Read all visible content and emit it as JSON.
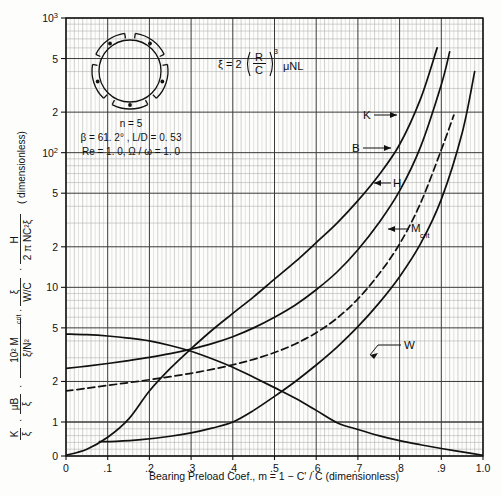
{
  "figure": {
    "background": "#fdfdfc",
    "ink": "#111111",
    "grid_major": "#3a3a3a",
    "grid_minor": "#9a9a9a"
  },
  "axes": {
    "x_title": "Bearing Preload Coef., m = 1 − C' / C (dimensionless)",
    "x_ticks": [
      "0",
      ".1",
      ".2",
      ".3",
      ".4",
      ".5",
      ".6",
      ".7",
      ".8",
      ".9",
      "1.0"
    ],
    "x_values": [
      0,
      0.1,
      0.2,
      0.3,
      0.4,
      0.5,
      0.6,
      0.7,
      0.8,
      0.9,
      1.0
    ],
    "y_ticks": [
      "0",
      "1",
      "2",
      "5",
      "10",
      "2",
      "5",
      "10²",
      "2",
      "5",
      "10³"
    ],
    "y_values": [
      0,
      1,
      2,
      5,
      10,
      20,
      50,
      100,
      200,
      500,
      1000
    ],
    "y_scale": "log",
    "x_scale": "linear",
    "y_title_parts": {
      "t1_num": "K",
      "t1_den": "ξ",
      "t2_num": "μB",
      "t2_den": "ξ",
      "t3_num": "10² M",
      "t3_sub": "crit",
      "t3_den": "ξ/N²",
      "t4_num": "ξ",
      "t4_den": "W/C",
      "t5_num": "H",
      "t5_den": "2 π NC²ξ",
      "tail": "( dimensionless)"
    }
  },
  "equation": {
    "lhs": "ξ = 2",
    "paren_num": "R",
    "paren_den": "C",
    "exponent": "3",
    "rhs": "μNL"
  },
  "inset": {
    "lobes": 5,
    "lines": [
      "n = 5",
      "β = 61. 2° ,  L/D = 0. 53",
      "Re = 1. 0,    Ω / ω = 1. 0"
    ],
    "line1": "n = 5",
    "line2": "β = 61. 2° ,  L/D = 0. 53",
    "line3": "Re = 1. 0,    Ω / ω = 1. 0"
  },
  "curve_labels": {
    "K": "K",
    "B": "B",
    "H": "H",
    "Mcrit_main": "M",
    "Mcrit_sub": "crit",
    "W": "W"
  },
  "chart_data": {
    "type": "line",
    "title": "",
    "xlabel": "Bearing Preload Coef., m = 1 − C' / C (dimensionless)",
    "ylabel": "K/ξ · μB/ξ · 10² M_crit/(ξ/N²) · ξ/(W/C) · H/(2πNC²ξ) (dimensionless)",
    "xlim": [
      0,
      1.0
    ],
    "ylim": [
      0,
      1000
    ],
    "yscale": "log",
    "grid": true,
    "legend": "inline-labels",
    "series": [
      {
        "name": "W",
        "style": "solid",
        "x": [
          0.0,
          0.05,
          0.1,
          0.15,
          0.2,
          0.25,
          0.3,
          0.35,
          0.4,
          0.45,
          0.5,
          0.55,
          0.6,
          0.65,
          0.7,
          0.75,
          0.8,
          0.85,
          0.9,
          0.95,
          1.0
        ],
        "values": [
          4.5,
          4.45,
          4.35,
          4.2,
          4.0,
          3.7,
          3.35,
          2.95,
          2.55,
          2.15,
          1.8,
          1.5,
          1.22,
          0.98,
          0.78,
          0.6,
          0.45,
          0.33,
          0.22,
          0.12,
          0.02
        ]
      },
      {
        "name": "H",
        "style": "dashed",
        "x": [
          0.0,
          0.05,
          0.1,
          0.15,
          0.2,
          0.25,
          0.3,
          0.35,
          0.4,
          0.45,
          0.5,
          0.55,
          0.6,
          0.65,
          0.7,
          0.75,
          0.8,
          0.85,
          0.9,
          0.93
        ],
        "values": [
          1.7,
          1.78,
          1.87,
          1.96,
          2.06,
          2.17,
          2.3,
          2.46,
          2.66,
          2.92,
          3.28,
          3.8,
          4.6,
          5.9,
          8.2,
          12.5,
          21.0,
          42.0,
          105.0,
          190.0
        ]
      },
      {
        "name": "B",
        "style": "solid",
        "x": [
          0.0,
          0.05,
          0.1,
          0.15,
          0.2,
          0.25,
          0.3,
          0.35,
          0.4,
          0.45,
          0.5,
          0.55,
          0.6,
          0.65,
          0.7,
          0.75,
          0.8,
          0.85,
          0.9,
          0.92
        ],
        "values": [
          2.5,
          2.6,
          2.72,
          2.86,
          3.02,
          3.22,
          3.48,
          3.82,
          4.3,
          5.0,
          6.0,
          7.4,
          9.6,
          13.0,
          19.0,
          30.0,
          52.0,
          110.0,
          320.0,
          560.0
        ]
      },
      {
        "name": "K",
        "style": "solid",
        "x": [
          0.0,
          0.05,
          0.1,
          0.15,
          0.2,
          0.25,
          0.3,
          0.35,
          0.4,
          0.45,
          0.5,
          0.55,
          0.6,
          0.65,
          0.7,
          0.75,
          0.8,
          0.85,
          0.89
        ],
        "values": [
          0.02,
          0.2,
          0.55,
          1.05,
          1.7,
          2.5,
          3.5,
          4.8,
          6.4,
          8.5,
          11.5,
          15.5,
          21.5,
          30.0,
          44.0,
          68.0,
          115.0,
          250.0,
          600.0
        ]
      },
      {
        "name": "M_crit",
        "style": "solid",
        "x": [
          0.08,
          0.12,
          0.18,
          0.25,
          0.3,
          0.35,
          0.4,
          0.45,
          0.5,
          0.55,
          0.6,
          0.65,
          0.7,
          0.75,
          0.8,
          0.85,
          0.9,
          0.95,
          0.98
        ],
        "values": [
          0.42,
          0.43,
          0.48,
          0.58,
          0.68,
          0.82,
          1.0,
          1.22,
          1.55,
          2.0,
          2.65,
          3.6,
          5.1,
          7.6,
          12.0,
          21.0,
          45.0,
          140.0,
          400.0
        ]
      }
    ]
  }
}
